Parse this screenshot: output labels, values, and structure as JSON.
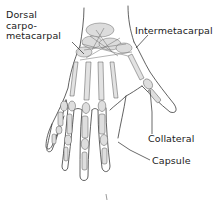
{
  "diagram": {
    "labels": {
      "dorsal_carpometacarpal": [
        "Dorsal",
        "carpo-",
        "metacarpal"
      ],
      "intermetacarpal": "Intermetacarpal",
      "collateral": "Collateral",
      "capsule": "Capsule"
    },
    "colors": {
      "line": "#3a3a3a",
      "bone_shade": "#b9b9b9",
      "background": "#ffffff"
    }
  }
}
